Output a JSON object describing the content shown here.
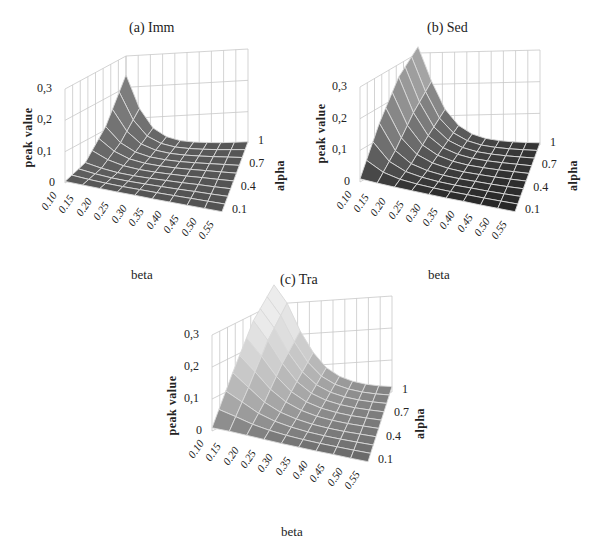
{
  "figure": {
    "panels": [
      {
        "id": "a",
        "title": "(a) Imm"
      },
      {
        "id": "b",
        "title": "(b) Sed"
      },
      {
        "id": "c",
        "title": "(c) Tra"
      }
    ]
  },
  "axes": {
    "zlabel": "peak value",
    "ylabel": "alpha",
    "xlabel": "beta",
    "zticks": [
      "0",
      "0,1",
      "0,2",
      "0,3"
    ],
    "yticks": [
      "0.1",
      "0.4",
      "0.7",
      "1"
    ],
    "xticks": [
      "0.10",
      "0.15",
      "0.20",
      "0.25",
      "0.30",
      "0.35",
      "0.40",
      "0.45",
      "0.50",
      "0.55"
    ]
  },
  "colors": {
    "grid": "#c8c8c8",
    "mesh_line": "#d9d9d9",
    "imm_surface": "#5a5a5a",
    "sed_surface_low": "#262626",
    "sed_surface_high": "#9a9a9a",
    "tra_surface_low": "#6e6e6e",
    "tra_surface_high": "#e2e2e2"
  },
  "chart_data": [
    {
      "type": "surface",
      "title": "(a) Imm",
      "xlabel": "beta",
      "ylabel": "alpha",
      "zlabel": "peak value",
      "x": [
        0.1,
        0.15,
        0.2,
        0.25,
        0.3,
        0.35,
        0.4,
        0.45,
        0.5,
        0.55
      ],
      "y": [
        0.1,
        0.4,
        0.7,
        1.0
      ],
      "zlim": [
        0,
        0.3
      ],
      "z_ticks": [
        0,
        0.1,
        0.2,
        0.3
      ],
      "grid": true,
      "z_by_alpha": [
        [
          0.005,
          0.004,
          0.003,
          0.002,
          0.002,
          0.001,
          0.001,
          0.001,
          0.001,
          0.001
        ],
        [
          0.03,
          0.018,
          0.01,
          0.006,
          0.004,
          0.003,
          0.002,
          0.002,
          0.001,
          0.001
        ],
        [
          0.11,
          0.06,
          0.032,
          0.018,
          0.011,
          0.007,
          0.005,
          0.004,
          0.003,
          0.002
        ],
        [
          0.24,
          0.13,
          0.065,
          0.035,
          0.02,
          0.013,
          0.009,
          0.006,
          0.005,
          0.004
        ]
      ]
    },
    {
      "type": "surface",
      "title": "(b) Sed",
      "xlabel": "beta",
      "ylabel": "alpha",
      "zlabel": "peak value",
      "x": [
        0.1,
        0.15,
        0.2,
        0.25,
        0.3,
        0.35,
        0.4,
        0.45,
        0.5,
        0.55
      ],
      "y": [
        0.1,
        0.4,
        0.7,
        1.0
      ],
      "zlim": [
        0,
        0.3
      ],
      "z_ticks": [
        0,
        0.1,
        0.2,
        0.3
      ],
      "grid": true,
      "z_by_alpha": [
        [
          0.01,
          0.007,
          0.005,
          0.004,
          0.003,
          0.002,
          0.002,
          0.001,
          0.001,
          0.001
        ],
        [
          0.15,
          0.07,
          0.035,
          0.02,
          0.012,
          0.008,
          0.006,
          0.004,
          0.003,
          0.003
        ],
        [
          0.26,
          0.15,
          0.08,
          0.045,
          0.027,
          0.017,
          0.012,
          0.009,
          0.007,
          0.005
        ],
        [
          0.32,
          0.21,
          0.12,
          0.068,
          0.04,
          0.025,
          0.017,
          0.012,
          0.009,
          0.007
        ]
      ]
    },
    {
      "type": "surface",
      "title": "(c) Tra",
      "xlabel": "beta",
      "ylabel": "alpha",
      "zlabel": "peak value",
      "x": [
        0.1,
        0.15,
        0.2,
        0.25,
        0.3,
        0.35,
        0.4,
        0.45,
        0.5,
        0.55
      ],
      "y": [
        0.1,
        0.4,
        0.7,
        1.0
      ],
      "zlim": [
        0,
        0.3
      ],
      "z_ticks": [
        0,
        0.1,
        0.2,
        0.3
      ],
      "grid": true,
      "z_by_alpha": [
        [
          0.01,
          0.01,
          0.008,
          0.006,
          0.004,
          0.003,
          0.002,
          0.002,
          0.001,
          0.001
        ],
        [
          0.15,
          0.11,
          0.07,
          0.045,
          0.03,
          0.02,
          0.014,
          0.01,
          0.008,
          0.006
        ],
        [
          0.28,
          0.22,
          0.15,
          0.095,
          0.06,
          0.04,
          0.028,
          0.02,
          0.015,
          0.011
        ],
        [
          0.36,
          0.3,
          0.21,
          0.14,
          0.09,
          0.06,
          0.042,
          0.03,
          0.022,
          0.017
        ]
      ]
    }
  ]
}
